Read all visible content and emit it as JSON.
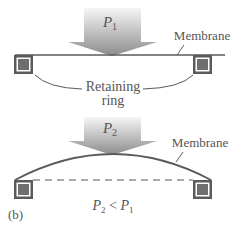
{
  "panel_a": {
    "pressure_label": "P",
    "pressure_sub": "1",
    "membrane_label": "Membrane",
    "ring_label_line1": "Retaining",
    "ring_label_line2": "ring"
  },
  "panel_b": {
    "pressure_label": "P",
    "pressure_sub": "2",
    "membrane_label": "Membrane",
    "relation_p2": "P",
    "relation_p2_sub": "2",
    "relation_op": " < ",
    "relation_p1": "P",
    "relation_p1_sub": "1",
    "panel_tag": "(b)"
  },
  "colors": {
    "line": "#5a5a5a",
    "square_fill": "#6e6e6e",
    "square_border": "#5a5a5a",
    "arrow_top": "#f4f4f4",
    "arrow_bottom": "#8a8a8a",
    "text": "#555555"
  }
}
